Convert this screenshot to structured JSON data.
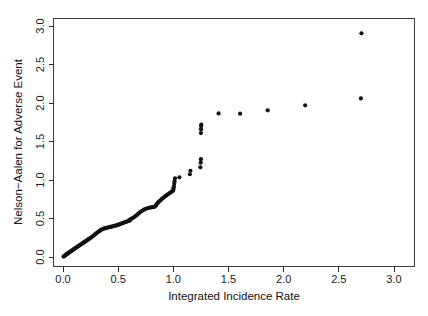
{
  "chart_data": {
    "type": "scatter",
    "title": "",
    "xlabel": "Integrated Incidence Rate",
    "ylabel": "Nelson−Aalen for Adverse Event",
    "xlim": [
      0.0,
      3.1
    ],
    "ylim": [
      0.0,
      3.05
    ],
    "xticks": [
      0.0,
      0.5,
      1.0,
      1.5,
      2.0,
      2.5,
      3.0
    ],
    "xticklabels": [
      "0.0",
      "0.5",
      "1.0",
      "1.5",
      "2.0",
      "2.5",
      "3.0"
    ],
    "yticks": [
      0.0,
      0.5,
      1.0,
      1.5,
      2.0,
      2.5,
      3.0
    ],
    "yticklabels": [
      "0.0",
      "0.5",
      "1.0",
      "1.5",
      "2.0",
      "2.5",
      "3.0"
    ],
    "grid": false,
    "legend": null,
    "marker": "filled-circle",
    "marker_color": "#111111",
    "marker_size": 2.1,
    "series": [
      {
        "name": "Nelson-Aalen vs Integrated Incidence Rate",
        "points": [
          [
            0.005,
            0.005
          ],
          [
            0.01,
            0.01
          ],
          [
            0.015,
            0.016
          ],
          [
            0.02,
            0.022
          ],
          [
            0.026,
            0.028
          ],
          [
            0.032,
            0.034
          ],
          [
            0.038,
            0.041
          ],
          [
            0.044,
            0.047
          ],
          [
            0.05,
            0.053
          ],
          [
            0.057,
            0.06
          ],
          [
            0.063,
            0.067
          ],
          [
            0.07,
            0.073
          ],
          [
            0.077,
            0.08
          ],
          [
            0.084,
            0.087
          ],
          [
            0.091,
            0.094
          ],
          [
            0.098,
            0.101
          ],
          [
            0.105,
            0.108
          ],
          [
            0.113,
            0.116
          ],
          [
            0.12,
            0.123
          ],
          [
            0.128,
            0.131
          ],
          [
            0.136,
            0.139
          ],
          [
            0.144,
            0.146
          ],
          [
            0.152,
            0.154
          ],
          [
            0.16,
            0.162
          ],
          [
            0.168,
            0.17
          ],
          [
            0.177,
            0.178
          ],
          [
            0.185,
            0.186
          ],
          [
            0.194,
            0.194
          ],
          [
            0.202,
            0.202
          ],
          [
            0.211,
            0.211
          ],
          [
            0.22,
            0.219
          ],
          [
            0.229,
            0.228
          ],
          [
            0.238,
            0.237
          ],
          [
            0.247,
            0.246
          ],
          [
            0.256,
            0.256
          ],
          [
            0.266,
            0.266
          ],
          [
            0.275,
            0.276
          ],
          [
            0.285,
            0.287
          ],
          [
            0.294,
            0.298
          ],
          [
            0.304,
            0.309
          ],
          [
            0.314,
            0.32
          ],
          [
            0.324,
            0.331
          ],
          [
            0.334,
            0.342
          ],
          [
            0.344,
            0.352
          ],
          [
            0.355,
            0.36
          ],
          [
            0.365,
            0.366
          ],
          [
            0.376,
            0.371
          ],
          [
            0.386,
            0.375
          ],
          [
            0.397,
            0.379
          ],
          [
            0.408,
            0.383
          ],
          [
            0.419,
            0.387
          ],
          [
            0.43,
            0.391
          ],
          [
            0.441,
            0.395
          ],
          [
            0.452,
            0.399
          ],
          [
            0.463,
            0.403
          ],
          [
            0.475,
            0.407
          ],
          [
            0.486,
            0.412
          ],
          [
            0.498,
            0.417
          ],
          [
            0.51,
            0.423
          ],
          [
            0.521,
            0.429
          ],
          [
            0.533,
            0.436
          ],
          [
            0.545,
            0.443
          ],
          [
            0.557,
            0.45
          ],
          [
            0.569,
            0.456
          ],
          [
            0.582,
            0.462
          ],
          [
            0.594,
            0.468
          ],
          [
            0.606,
            0.473
          ],
          [
            0.602,
            0.484
          ],
          [
            0.614,
            0.492
          ],
          [
            0.627,
            0.502
          ],
          [
            0.639,
            0.513
          ],
          [
            0.652,
            0.526
          ],
          [
            0.665,
            0.54
          ],
          [
            0.678,
            0.556
          ],
          [
            0.691,
            0.572
          ],
          [
            0.704,
            0.587
          ],
          [
            0.717,
            0.6
          ],
          [
            0.731,
            0.612
          ],
          [
            0.744,
            0.622
          ],
          [
            0.758,
            0.63
          ],
          [
            0.772,
            0.636
          ],
          [
            0.786,
            0.641
          ],
          [
            0.8,
            0.645
          ],
          [
            0.814,
            0.648
          ],
          [
            0.828,
            0.652
          ],
          [
            0.838,
            0.661
          ],
          [
            0.845,
            0.676
          ],
          [
            0.852,
            0.69
          ],
          [
            0.86,
            0.703
          ],
          [
            0.868,
            0.716
          ],
          [
            0.877,
            0.728
          ],
          [
            0.886,
            0.74
          ],
          [
            0.895,
            0.752
          ],
          [
            0.905,
            0.764
          ],
          [
            0.915,
            0.776
          ],
          [
            0.925,
            0.788
          ],
          [
            0.936,
            0.8
          ],
          [
            0.948,
            0.812
          ],
          [
            0.96,
            0.824
          ],
          [
            0.972,
            0.836
          ],
          [
            0.985,
            0.848
          ],
          [
            0.998,
            0.862
          ],
          [
            1.0,
            0.878
          ],
          [
            1.002,
            0.895
          ],
          [
            1.005,
            0.915
          ],
          [
            1.008,
            0.95
          ],
          [
            1.011,
            0.985
          ],
          [
            1.015,
            1.022
          ],
          [
            1.055,
            1.035
          ],
          [
            1.15,
            1.075
          ],
          [
            1.155,
            1.12
          ],
          [
            1.245,
            1.165
          ],
          [
            1.248,
            1.225
          ],
          [
            1.25,
            1.27
          ],
          [
            1.25,
            1.61
          ],
          [
            1.251,
            1.66
          ],
          [
            1.252,
            1.7
          ],
          [
            1.253,
            1.72
          ],
          [
            1.41,
            1.865
          ],
          [
            1.605,
            1.862
          ],
          [
            1.855,
            1.905
          ],
          [
            2.195,
            1.97
          ],
          [
            2.7,
            2.06
          ],
          [
            2.705,
            2.905
          ]
        ]
      }
    ],
    "n_points": 122
  },
  "axes": {
    "x_title": "Integrated Incidence Rate",
    "y_title": "Nelson−Aalen for Adverse Event"
  }
}
